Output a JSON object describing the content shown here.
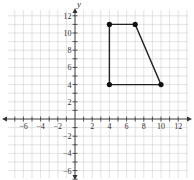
{
  "chart_data": {
    "type": "line",
    "title": "",
    "xlabel": "x",
    "ylabel": "y",
    "xlim": [
      -7.5,
      13
    ],
    "ylim": [
      -7,
      13
    ],
    "grid": true,
    "x_ticks": [
      -6,
      -4,
      -2,
      2,
      4,
      6,
      8,
      10,
      12
    ],
    "y_ticks": [
      -6,
      -4,
      -2,
      2,
      4,
      6,
      8,
      10,
      12
    ],
    "series": [
      {
        "name": "quadrilateral",
        "closed": true,
        "points": [
          [
            4,
            11
          ],
          [
            7,
            11
          ],
          [
            10,
            4
          ],
          [
            4,
            4
          ]
        ]
      }
    ]
  }
}
